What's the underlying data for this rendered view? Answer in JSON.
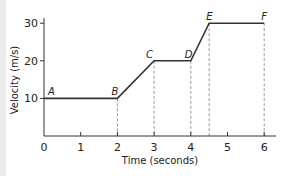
{
  "chart_data": {
    "type": "line",
    "title": "",
    "xlabel": "Time (seconds)",
    "ylabel": "Velocity (m/s)",
    "xlim": [
      0,
      6.3
    ],
    "ylim": [
      0,
      32
    ],
    "x_ticks": [
      "0",
      "1",
      "2",
      "3",
      "4",
      "5",
      "6"
    ],
    "y_ticks": [
      "10",
      "20",
      "30"
    ],
    "grid": false,
    "points": [
      {
        "label": "A",
        "x": 0,
        "y": 10
      },
      {
        "label": "B",
        "x": 2,
        "y": 10
      },
      {
        "label": "C",
        "x": 3,
        "y": 20
      },
      {
        "label": "D",
        "x": 4,
        "y": 20
      },
      {
        "label": "E",
        "x": 4.5,
        "y": 30
      },
      {
        "label": "F",
        "x": 6,
        "y": 30
      }
    ],
    "dashed_verticals_at_x": [
      2,
      3,
      4,
      4.5,
      6
    ],
    "line_color": "#333333",
    "dashed_color": "#999999"
  }
}
